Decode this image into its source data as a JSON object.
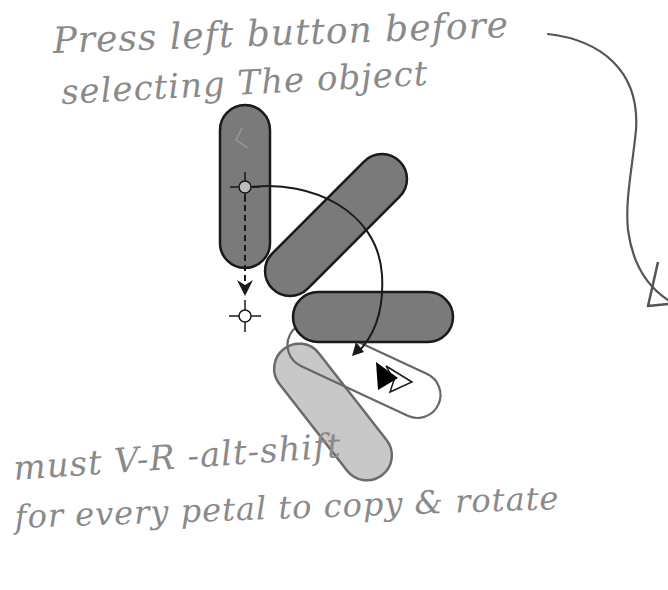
{
  "annotations": {
    "top_line_1": "Press left button before",
    "top_line_2": "selecting The object",
    "bottom_line_1": "must V-R -alt-shift",
    "bottom_line_2": "for every petal to copy & rotate"
  },
  "diagram": {
    "colors": {
      "petal_dark": "#7a7a7a",
      "petal_light": "#c8c8c8",
      "outline": "#1a1a1a",
      "sketch": "#666666",
      "handwriting": "#8a8a8a",
      "pivot_fill": "#bdbdbd"
    },
    "shapes": [
      {
        "id": "petal-vertical",
        "fill": "dark",
        "angle_deg": 90
      },
      {
        "id": "petal-diagonal",
        "fill": "dark",
        "angle_deg": -45
      },
      {
        "id": "petal-horizontal",
        "fill": "dark",
        "angle_deg": 0
      },
      {
        "id": "petal-outline-sketch",
        "fill": "none",
        "angle_deg": 25
      },
      {
        "id": "petal-light-copy",
        "fill": "light",
        "angle_deg": 52
      }
    ],
    "markers": [
      {
        "id": "pivot-crosshair",
        "type": "crosshair-filled"
      },
      {
        "id": "target-crosshair",
        "type": "crosshair-hollow"
      },
      {
        "id": "cursor-arrow",
        "type": "cursor-black-and-white"
      }
    ]
  }
}
